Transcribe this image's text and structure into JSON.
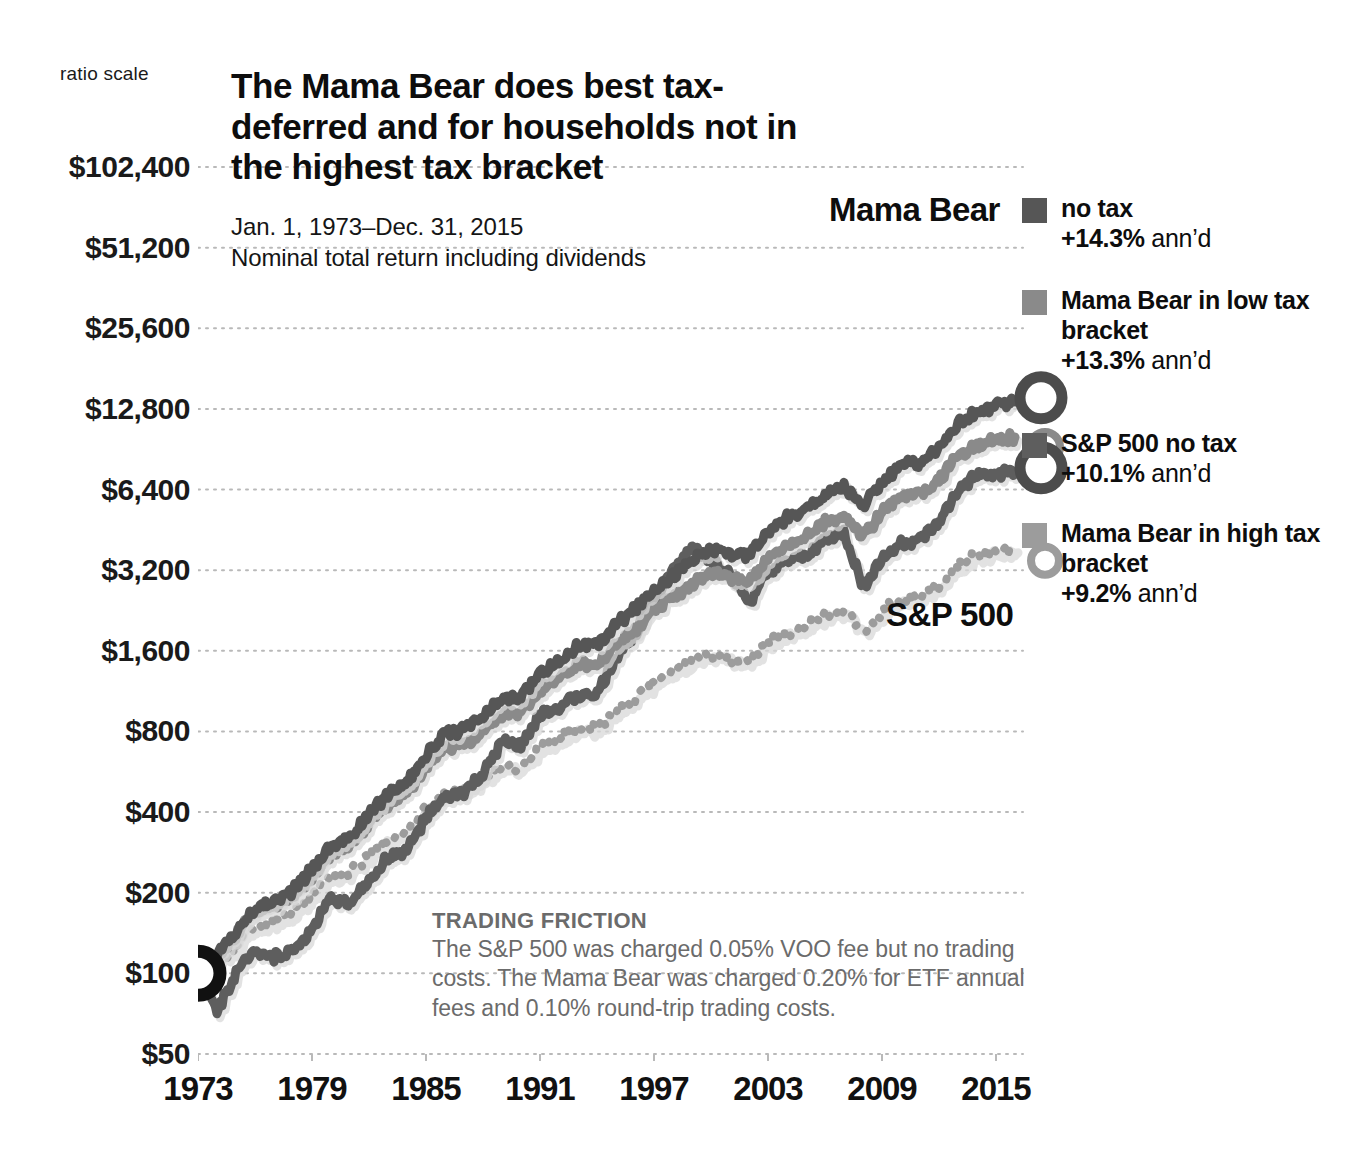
{
  "header": {
    "ratio_scale_label": "ratio scale",
    "title": "The Mama Bear does best tax-deferred and for households not in the highest tax bracket",
    "subtitle_line1": "Jan. 1, 1973–Dec. 31, 2015",
    "subtitle_line2": "Nominal total return including dividends"
  },
  "annotations": {
    "mama_bear": "Mama Bear",
    "sp500": "S&P 500"
  },
  "legend": [
    {
      "label": "no tax",
      "pct": "+14.3%",
      "suffix": "ann’d",
      "color": "#565656"
    },
    {
      "label": "Mama Bear in low tax bracket",
      "pct": "+13.3%",
      "suffix": "ann’d",
      "color": "#8a8a8a"
    },
    {
      "label": "S&P 500 no tax",
      "pct": "+10.1%",
      "suffix": "ann’d",
      "color": "#5e5e5e"
    },
    {
      "label": "Mama Bear in high tax bracket",
      "pct": "+9.2%",
      "suffix": "ann’d",
      "color": "#9c9c9c"
    }
  ],
  "note": {
    "heading": "TRADING FRICTION",
    "body": "The S&P 500 was charged 0.05% VOO fee but no trading costs. The Mama Bear was charged 0.20% for ETF annual fees and 0.10% round-trip trading costs."
  },
  "chart_data": {
    "type": "line",
    "title": "The Mama Bear does best tax-deferred and for households not in the highest tax bracket",
    "subtitle": "Jan. 1, 1973–Dec. 31, 2015 — Nominal total return including dividends",
    "xlabel": "",
    "ylabel": "ratio scale",
    "yscale": "log",
    "ylim": [
      50,
      102400
    ],
    "xlim": [
      1973,
      2016
    ],
    "grid": true,
    "grid_style": "dotted",
    "legend_position": "right",
    "yticks": [
      102400,
      51200,
      25600,
      12800,
      6400,
      3200,
      1600,
      800,
      400,
      200,
      100,
      50
    ],
    "ytick_labels": [
      "$102,400",
      "$51,200",
      "$25,600",
      "$12,800",
      "$6,400",
      "$3,200",
      "$1,600",
      "$800",
      "$400",
      "$200",
      "$100",
      "$50"
    ],
    "xticks": [
      1973,
      1979,
      1985,
      1991,
      1997,
      2003,
      2009,
      2015
    ],
    "xtick_labels": [
      "1973",
      "1979",
      "1985",
      "1991",
      "1997",
      "2003",
      "2009",
      "2015"
    ],
    "start_value": 100,
    "x": [
      1973,
      1974,
      1975,
      1976,
      1977,
      1978,
      1979,
      1980,
      1981,
      1982,
      1983,
      1984,
      1985,
      1986,
      1987,
      1988,
      1989,
      1990,
      1991,
      1992,
      1993,
      1994,
      1995,
      1996,
      1997,
      1998,
      1999,
      2000,
      2001,
      2002,
      2003,
      2004,
      2005,
      2006,
      2007,
      2008,
      2009,
      2010,
      2011,
      2012,
      2013,
      2014,
      2015,
      2016
    ],
    "series": [
      {
        "name": "Mama Bear no tax",
        "annualized_pct": 14.3,
        "color": "#565656",
        "style": "solid",
        "end_marker": "donut-dark",
        "values": [
          100,
          118,
          142,
          176,
          186,
          204,
          246,
          300,
          322,
          392,
          470,
          520,
          651,
          780,
          812,
          905,
          1062,
          1070,
          1330,
          1452,
          1690,
          1668,
          2010,
          2290,
          2720,
          3060,
          3480,
          3810,
          3700,
          3640,
          4450,
          5000,
          5420,
          6150,
          6600,
          5500,
          6800,
          7900,
          8100,
          9200,
          11300,
          12400,
          13200,
          13600
        ]
      },
      {
        "name": "Mama Bear in low tax bracket",
        "annualized_pct": 13.3,
        "color": "#8a8a8a",
        "style": "solid",
        "end_marker": "donut-mid",
        "values": [
          100,
          116,
          138,
          170,
          178,
          194,
          232,
          281,
          298,
          360,
          428,
          470,
          585,
          696,
          720,
          798,
          930,
          930,
          1150,
          1248,
          1442,
          1416,
          1695,
          1920,
          2265,
          2530,
          2860,
          3110,
          3000,
          2930,
          3560,
          3980,
          4290,
          4840,
          5160,
          4270,
          5250,
          6060,
          6180,
          6970,
          8500,
          9250,
          9800,
          10050
        ]
      },
      {
        "name": "S&P 500 no tax",
        "annualized_pct": 10.1,
        "color": "#5e5e5e",
        "style": "solid",
        "end_marker": "donut-dark",
        "values": [
          100,
          73,
          100,
          124,
          115,
          122,
          145,
          192,
          182,
          222,
          272,
          289,
          380,
          451,
          475,
          553,
          728,
          705,
          920,
          990,
          1090,
          1104,
          1518,
          1866,
          2489,
          3200,
          3872,
          3520,
          3102,
          2416,
          3110,
          3450,
          3616,
          4188,
          4419,
          2784,
          3522,
          4052,
          4138,
          4800,
          6350,
          7220,
          7320,
          7450
        ]
      },
      {
        "name": "Mama Bear in high tax bracket",
        "annualized_pct": 9.2,
        "color": "#9c9c9c",
        "style": "dotted",
        "end_marker": "donut-light",
        "values": [
          100,
          110,
          126,
          150,
          156,
          166,
          193,
          227,
          238,
          278,
          320,
          342,
          412,
          474,
          484,
          524,
          598,
          590,
          700,
          746,
          840,
          820,
          955,
          1060,
          1220,
          1335,
          1470,
          1560,
          1500,
          1450,
          1720,
          1880,
          1980,
          2180,
          2280,
          1880,
          2250,
          2520,
          2540,
          2800,
          3350,
          3620,
          3780,
          3850
        ]
      }
    ]
  }
}
